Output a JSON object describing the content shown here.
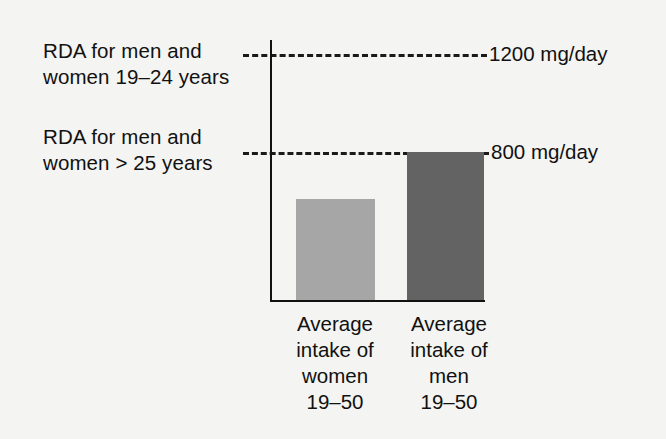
{
  "chart_data": {
    "type": "bar",
    "title": "",
    "subtitle": "",
    "xlabel": "",
    "ylabel": "",
    "unit": "mg/day",
    "ylim": [
      0,
      1300
    ],
    "grid": false,
    "legend_position": "none",
    "categories": [
      "Average intake of women 19–50",
      "Average intake of men 19–50"
    ],
    "values": [
      550,
      800
    ],
    "bar_colors": [
      "#a6a6a6",
      "#636363"
    ],
    "reference_lines": [
      {
        "value": 1200,
        "value_label": "1200 mg/day",
        "description_line1": "RDA for men and",
        "description_line2": "women 19–24 years",
        "style": "dashed",
        "color": "#1a1a1a"
      },
      {
        "value": 800,
        "value_label": "800 mg/day",
        "description_line1": "RDA for men and",
        "description_line2": "women > 25 years",
        "style": "dashed",
        "color": "#1a1a1a"
      }
    ],
    "bars": [
      {
        "name": "women",
        "value": 550,
        "color": "#a6a6a6",
        "label_lines": [
          "Average",
          "intake of",
          "women",
          "19–50"
        ]
      },
      {
        "name": "men",
        "value": 800,
        "color": "#636363",
        "label_lines": [
          "Average",
          "intake of",
          "men",
          "19–50"
        ]
      }
    ],
    "axis_color": "#111111",
    "background_color": "#f4f4f2"
  }
}
